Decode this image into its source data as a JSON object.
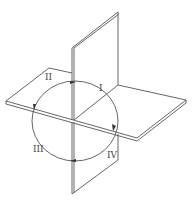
{
  "diagram": {
    "quadrants": [
      {
        "id": "q1",
        "label": "I"
      },
      {
        "id": "q2",
        "label": "II"
      },
      {
        "id": "q3",
        "label": "III"
      },
      {
        "id": "q4",
        "label": "IV"
      }
    ],
    "colors": {
      "line": "#555555",
      "background": "#ffffff"
    }
  }
}
